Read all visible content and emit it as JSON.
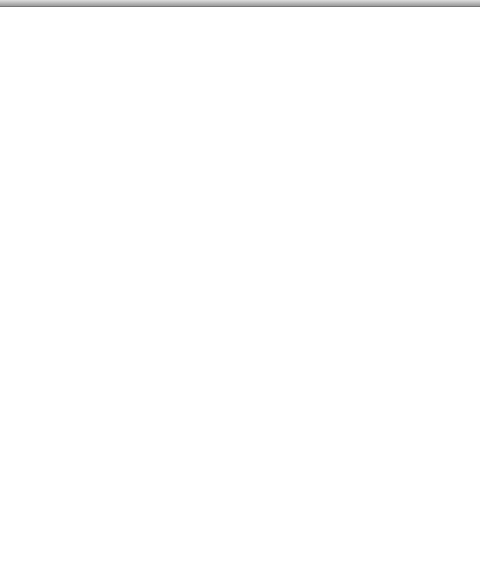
{
  "map": {
    "colonial_powers": [
      {
        "id": "russian",
        "label": "Russian"
      },
      {
        "id": "english-north",
        "label": "English"
      },
      {
        "id": "french",
        "label": "French"
      },
      {
        "id": "english-newengland",
        "label": "English"
      },
      {
        "id": "dutch",
        "label": "Dutch"
      },
      {
        "id": "swedish",
        "label": "Swedish"
      },
      {
        "id": "english-south",
        "label": "English"
      },
      {
        "id": "spanish-mexico",
        "label": "Spanish"
      },
      {
        "id": "spanish-caribbean",
        "label": "Spanish"
      }
    ],
    "native_peoples": [
      {
        "id": "tlingit",
        "label": "Tlingit"
      },
      {
        "id": "haida",
        "label": "Haida"
      },
      {
        "id": "inuit-west",
        "label": "Inuit"
      },
      {
        "id": "inuit-east",
        "label": "Inuit"
      },
      {
        "id": "chipewyan",
        "label": "Chipewyan"
      },
      {
        "id": "cree",
        "label": "Cree"
      },
      {
        "id": "beothuk",
        "label": "Beothuk"
      },
      {
        "id": "nootka",
        "label": "Nootka"
      },
      {
        "id": "micmac",
        "label": "Micmac"
      },
      {
        "id": "assiniboine",
        "label": "Assiniboine"
      },
      {
        "id": "anishinaabeg",
        "label": "Anishinaabeg"
      },
      {
        "id": "abenaki",
        "label": "Abenaki"
      },
      {
        "id": "chinook",
        "label": "Chinook"
      },
      {
        "id": "blackfeet",
        "label": "Blackfeet"
      },
      {
        "id": "huron",
        "label": "Huron"
      },
      {
        "id": "iroquois",
        "label": "Iroquois"
      },
      {
        "id": "mandan",
        "label": "Mandan"
      },
      {
        "id": "sioux",
        "label": "Sioux"
      },
      {
        "id": "shoshoni",
        "label": "Shoshoni"
      },
      {
        "id": "delaware",
        "label": "Delaware"
      },
      {
        "id": "shawnee",
        "label": "Shawnee"
      },
      {
        "id": "powhatan",
        "label": "Powhatan"
      },
      {
        "id": "chumash",
        "label": "Chumash"
      },
      {
        "id": "pawnee",
        "label": "Pawnee"
      },
      {
        "id": "navajo",
        "label": "Navajo"
      },
      {
        "id": "pueblo",
        "label": "Pueblo"
      },
      {
        "id": "comanche",
        "label": "Comanche"
      },
      {
        "id": "osage",
        "label": "Osage"
      },
      {
        "id": "apache",
        "label": "Apache"
      },
      {
        "id": "yaqui",
        "label": "Yaqui"
      },
      {
        "id": "cherokee",
        "label": "Cherokee"
      },
      {
        "id": "caddo",
        "label": "Caddo"
      },
      {
        "id": "choctaw",
        "label": "Choctaw"
      },
      {
        "id": "creek",
        "label": "Creek"
      },
      {
        "id": "natchez",
        "label": "Natchez"
      },
      {
        "id": "timucua",
        "label": "Timucua"
      },
      {
        "id": "calusa",
        "label": "Calusa"
      }
    ],
    "water_bodies": {
      "pacific": [
        "PACIFIC",
        "OCEAN"
      ],
      "atlantic": [
        "ATLANTIC",
        "OCEAN"
      ],
      "gulf": "Gulf of Mexico"
    },
    "scale": {
      "miles_ticks": [
        "0",
        "500",
        "1000 miles"
      ],
      "km_ticks": [
        "0",
        "500",
        "1000 kilometers"
      ]
    },
    "colors": {
      "land": "#c9c9c9",
      "land_dark": "#a8a8a8",
      "water": "#ffffff",
      "flow": "#8c8c8c",
      "flow_light": "#d6d6d6",
      "border": "#555555"
    }
  }
}
